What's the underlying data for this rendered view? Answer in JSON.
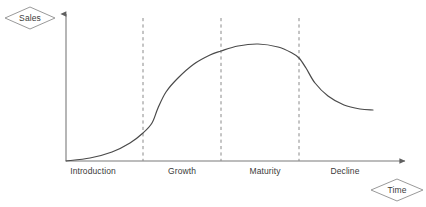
{
  "diagram": {
    "axes": {
      "y_label": "Sales",
      "x_label": "Time",
      "y_label_shape": "diamond",
      "x_label_shape": "diamond",
      "axis_color": "#6b6b6b",
      "y_axis_arrow": "arrow-up",
      "x_axis_arrow": "arrow-right"
    },
    "stages": [
      {
        "label": "Introduction",
        "center_x": 93
      },
      {
        "label": "Growth",
        "center_x": 182
      },
      {
        "label": "Maturity",
        "center_x": 265
      },
      {
        "label": "Decline",
        "center_x": 345
      }
    ],
    "dividers": [
      {
        "x": 143
      },
      {
        "x": 221
      },
      {
        "x": 299
      }
    ],
    "curve_color": "#4a4a4a",
    "divider_color": "#8a8a8a",
    "text_color": "#3a3a3a"
  },
  "chart_data": {
    "type": "line",
    "xlabel": "Time",
    "ylabel": "Sales",
    "grid": false,
    "legend": null,
    "categories": [
      "Introduction",
      "Growth",
      "Maturity",
      "Decline"
    ],
    "stage_boundaries_x": [
      143,
      221,
      299
    ],
    "axis_origin": {
      "x": 66,
      "y": 161
    },
    "axis_extent": {
      "x_end": 410,
      "y_top": 10
    },
    "series": [
      {
        "name": "Sales",
        "points": [
          {
            "x": 66,
            "y": 161
          },
          {
            "x": 90,
            "y": 158
          },
          {
            "x": 112,
            "y": 152
          },
          {
            "x": 130,
            "y": 143
          },
          {
            "x": 143,
            "y": 133
          },
          {
            "x": 152,
            "y": 123
          },
          {
            "x": 158,
            "y": 108
          },
          {
            "x": 166,
            "y": 92
          },
          {
            "x": 178,
            "y": 78
          },
          {
            "x": 194,
            "y": 64
          },
          {
            "x": 210,
            "y": 55
          },
          {
            "x": 221,
            "y": 51
          },
          {
            "x": 238,
            "y": 46
          },
          {
            "x": 258,
            "y": 44
          },
          {
            "x": 278,
            "y": 47
          },
          {
            "x": 292,
            "y": 53
          },
          {
            "x": 299,
            "y": 58
          },
          {
            "x": 306,
            "y": 68
          },
          {
            "x": 315,
            "y": 83
          },
          {
            "x": 328,
            "y": 96
          },
          {
            "x": 344,
            "y": 105
          },
          {
            "x": 360,
            "y": 109
          },
          {
            "x": 373,
            "y": 110
          }
        ]
      }
    ],
    "annotations": [
      {
        "text": "Introduction",
        "x": 93,
        "y": 172
      },
      {
        "text": "Growth",
        "x": 182,
        "y": 172
      },
      {
        "text": "Maturity",
        "x": 265,
        "y": 172
      },
      {
        "text": "Decline",
        "x": 345,
        "y": 172
      }
    ]
  }
}
